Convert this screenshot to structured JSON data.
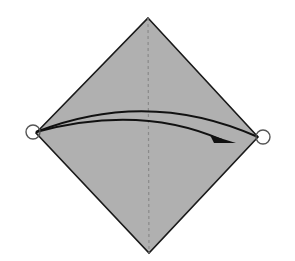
{
  "diagram": {
    "type": "origami-fold-step",
    "colors": {
      "background": "#ffffff",
      "paper_fill": "#b0b0b0",
      "outline": "#1a1a1a",
      "fold_line": "#8a8a8a",
      "arrow": "#111111",
      "point_marker": "#555555"
    },
    "paper": {
      "vertices": {
        "top": [
          148,
          18
        ],
        "right": [
          258,
          137
        ],
        "bottom": [
          149,
          253
        ],
        "left": [
          36,
          133
        ]
      }
    },
    "fold_line": {
      "style": "dashed",
      "from": [
        148,
        18
      ],
      "to": [
        149,
        253
      ]
    },
    "arrow": {
      "upper_path": "M36,132 Q148,88 258,137",
      "lower_path": "M36,132 Q140,104 222,140",
      "head": [
        [
          236,
          143
        ],
        [
          210,
          135
        ],
        [
          214,
          143
        ]
      ]
    },
    "markers": [
      {
        "name": "left-corner-circle",
        "cx": 33,
        "cy": 132,
        "r": 7
      },
      {
        "name": "right-corner-circle",
        "cx": 263,
        "cy": 137,
        "r": 7
      }
    ]
  }
}
